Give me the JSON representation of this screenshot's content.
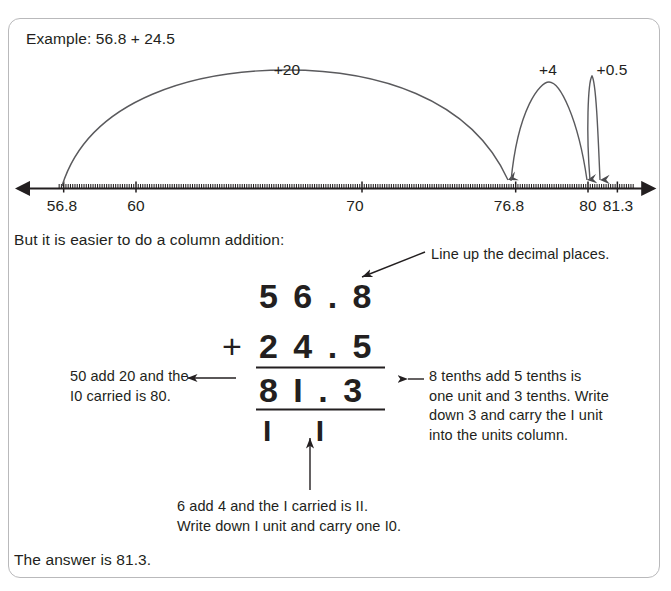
{
  "panel": {
    "example_heading": "Example: 56.8 + 24.5",
    "intro_text": "But it is easier to do a column addition:",
    "answer_text": "The answer is 81.3."
  },
  "numberline": {
    "labels": [
      {
        "text": "56.8",
        "x": 62
      },
      {
        "text": "60",
        "x": 136
      },
      {
        "text": "70",
        "x": 355
      },
      {
        "text": "76.8",
        "x": 509
      },
      {
        "text": "80",
        "x": 588
      },
      {
        "text": "81.3",
        "x": 618
      }
    ],
    "jumps": [
      {
        "label": "+20",
        "from": 56.8,
        "to": 76.8,
        "x_from": 62,
        "x_to": 509,
        "label_x": 287
      },
      {
        "label": "+4",
        "from": 76.8,
        "to": 80,
        "x_from": 509,
        "x_to": 588,
        "label_x": 548
      },
      {
        "label": "+0.5",
        "from": 80,
        "to": 81.3,
        "x_from": 588,
        "x_to": 601,
        "label_x": 610
      }
    ],
    "axis_min": 56.0,
    "axis_max": 82.4,
    "axis_y": 188
  },
  "column_addition": {
    "addend_1": "5 6 . 8",
    "operator": "+",
    "addend_2": "2 4 . 5",
    "sum": "8 I . 3",
    "carries": "I I"
  },
  "annotations": {
    "decimal_places": "Line up the decimal places.",
    "left_note": "50 add 20 and the\nI0 carried is 80.",
    "right_note": "8 tenths add 5 tenths is\none unit and 3 tenths. Write\ndown 3 and carry the I unit\ninto the units column.",
    "bottom_note": "6 add 4 and the I carried is II.\nWrite down I unit and carry one I0."
  },
  "colors": {
    "ink": "#231f20",
    "panel_border": "#b9b9bb",
    "rule": "#231f20"
  }
}
